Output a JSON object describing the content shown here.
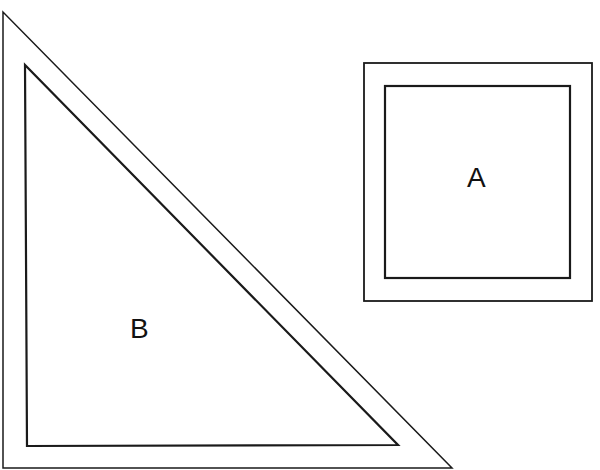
{
  "figure": {
    "shapes": [
      {
        "id": "A",
        "type": "square-frame",
        "label": "A"
      },
      {
        "id": "B",
        "type": "right-triangle-frame",
        "label": "B"
      }
    ],
    "line_color": "#1a1a1a",
    "background": "#ffffff"
  }
}
